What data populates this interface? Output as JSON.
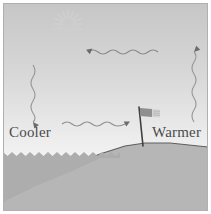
{
  "figure": {
    "width": 211,
    "height": 214,
    "background_color": "#ffffff",
    "border_color": "#b4b4b4"
  },
  "labels": {
    "cooler": "Cooler",
    "warmer": "Warmer"
  },
  "colors": {
    "sky_top": "#c9c9c9",
    "sky_bottom": "#fbfbfb",
    "water": "#b0b0b0",
    "land": "#b4b4b4",
    "ink": "#4a4a4a",
    "sun": "#d2d2d2",
    "flag_dark": "#8c8c8c",
    "flag_light": "#d8d8d8"
  },
  "elements": {
    "sun": {
      "name": "sun",
      "cx": 68,
      "cy": 24,
      "rays": 16,
      "inner_radius": 4,
      "outer_radius": 14
    },
    "arrows": [
      {
        "name": "wavy-arrow-left-upper",
        "direction": "left",
        "orientation": "horizontal",
        "x1": 158,
        "y1": 52,
        "x2": 78,
        "y2": 52
      },
      {
        "name": "wavy-arrow-down-left",
        "direction": "down",
        "orientation": "vertical",
        "x1": 33,
        "y1": 65,
        "x2": 33,
        "y2": 122
      },
      {
        "name": "wavy-arrow-up-right",
        "direction": "up",
        "orientation": "vertical",
        "x1": 194,
        "y1": 122,
        "x2": 194,
        "y2": 42
      },
      {
        "name": "wavy-arrow-right-lower",
        "direction": "right",
        "orientation": "horizontal",
        "x1": 62,
        "y1": 124,
        "x2": 135,
        "y2": 124
      }
    ],
    "flag": {
      "name": "flag-on-pole",
      "pole_top_x": 139,
      "pole_top_y": 107,
      "pole_bottom_x": 143,
      "pole_bottom_y": 146,
      "banner_width": 20,
      "banner_height": 9
    },
    "water": {
      "name": "water-body",
      "surface_y": 152,
      "zigzag_period": 9,
      "zigzag_amplitude": 4,
      "extent": "left"
    },
    "land": {
      "name": "land-hill",
      "crest_y": 143,
      "shore_x": 36,
      "slope": "rising left to right"
    }
  }
}
